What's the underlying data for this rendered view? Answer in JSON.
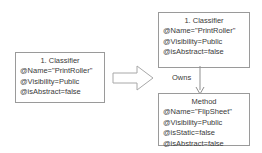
{
  "diagram": {
    "background_color": "#ffffff",
    "line_color": "#9a9a9a",
    "text_color": "#3a3a3a",
    "source_box": {
      "header": "1. Classifier",
      "attributes": [
        "@Name=\"PrintRoller\"",
        "@Visibility=Public",
        "@isAbstract=false"
      ]
    },
    "target_classifier_box": {
      "header": "1. Classifier",
      "attributes": [
        "@Name=\"PrintRoller\"",
        "@Visibility=Public",
        "@isAbstract=false"
      ]
    },
    "target_method_box": {
      "header": "Method",
      "attributes": [
        "@Name=\"FlipSheet\"",
        "@Visibility=Public",
        "@isStatic=false",
        "@isAbstract=false"
      ]
    },
    "association": {
      "label": "Owns"
    },
    "transform_arrow": {
      "icon": "block-arrow-right-icon",
      "direction": "right"
    }
  }
}
